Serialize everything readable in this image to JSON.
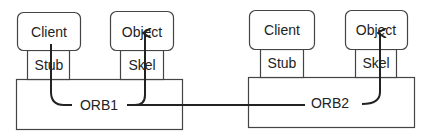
{
  "diagram": {
    "colors": {
      "stroke": "#444444",
      "text": "#222222",
      "background": "#ffffff"
    },
    "left_node": {
      "client": "Client",
      "stub": "Stub",
      "object": "Object",
      "skel": "Skel",
      "orb": "ORB1"
    },
    "right_node": {
      "client": "Client",
      "stub": "Stub",
      "object": "Object",
      "skel": "Skel",
      "orb": "ORB2"
    },
    "flows": [
      {
        "from": "Client (left)",
        "via": [
          "Stub",
          "ORB1"
        ],
        "to": "Object (left)",
        "via_to": "Skel"
      },
      {
        "from": "ORB1",
        "to": "ORB2",
        "then": "Skel",
        "to_final": "Object (right)"
      }
    ]
  }
}
